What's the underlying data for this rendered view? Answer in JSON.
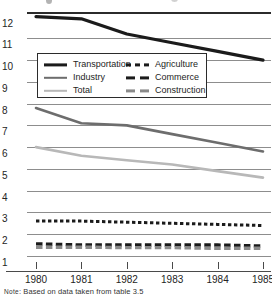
{
  "chart_data": {
    "type": "line",
    "title": "",
    "subtitle": "",
    "xlabel": "",
    "ylabel": "",
    "x": [
      1980,
      1981,
      1982,
      1983,
      1984,
      1985
    ],
    "xtick_labels": [
      "1980",
      "1981",
      "1982",
      "1983",
      "1984",
      "1985"
    ],
    "xlim": [
      1980,
      1985
    ],
    "ylim": [
      1,
      12
    ],
    "ytick_labels": [
      "12",
      "11",
      "10",
      "9",
      "8",
      "7",
      "6",
      "5",
      "4",
      "3",
      "2",
      "1"
    ],
    "yticks": [
      12,
      11,
      10,
      9,
      8,
      7,
      6,
      5,
      4,
      3,
      2,
      1
    ],
    "grid": true,
    "legend_position": "upper-center",
    "series": [
      {
        "name": "Transportation",
        "style": "solid",
        "color": "#1b1b1b",
        "width": 3.2,
        "values": [
          12.0,
          11.9,
          11.2,
          10.8,
          10.4,
          10.0
        ]
      },
      {
        "name": "Industry",
        "style": "solid",
        "color": "#6d6d6d",
        "width": 2.6,
        "values": [
          7.8,
          7.1,
          7.0,
          6.6,
          6.2,
          5.8
        ]
      },
      {
        "name": "Total",
        "style": "solid",
        "color": "#b8b8b8",
        "width": 2.6,
        "values": [
          6.0,
          5.6,
          5.4,
          5.2,
          4.9,
          4.6
        ]
      },
      {
        "name": "Agriculture",
        "style": "dotted",
        "color": "#1b1b1b",
        "width": 3.0,
        "values": [
          2.6,
          2.6,
          2.55,
          2.5,
          2.45,
          2.4
        ]
      },
      {
        "name": "Commerce",
        "style": "dashed",
        "color": "#1b1b1b",
        "width": 3.4,
        "values": [
          1.55,
          1.5,
          1.5,
          1.5,
          1.5,
          1.45
        ]
      },
      {
        "name": "Construction",
        "style": "dashed",
        "color": "#8a8a8a",
        "width": 3.4,
        "values": [
          1.4,
          1.4,
          1.38,
          1.38,
          1.35,
          1.35
        ]
      }
    ]
  },
  "legend": {
    "entries": [
      {
        "label": "Transportation",
        "style": "solid",
        "color": "#1b1b1b"
      },
      {
        "label": "Industry",
        "style": "solid",
        "color": "#6d6d6d"
      },
      {
        "label": "Total",
        "style": "solid",
        "color": "#b8b8b8"
      },
      {
        "label": "Agriculture",
        "style": "dotted",
        "color": "#1b1b1b"
      },
      {
        "label": "Commerce",
        "style": "dashed",
        "color": "#1b1b1b"
      },
      {
        "label": "Construction",
        "style": "dashed",
        "color": "#8a8a8a"
      }
    ]
  },
  "note": {
    "prefix": "Note",
    "text": ": Based on data taken from table 3.5"
  },
  "colors": {
    "gridline": "#8d8d8d",
    "top_rule": "#2b2b2b",
    "axis": "#4a4a4a",
    "text": "#242424",
    "background": "#ffffff"
  }
}
